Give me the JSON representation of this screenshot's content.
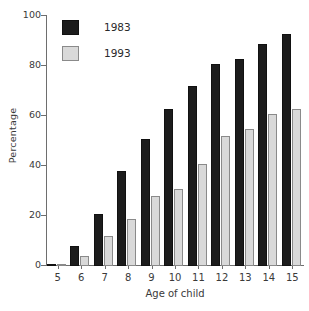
{
  "chart_data": {
    "type": "bar",
    "title": "",
    "xlabel": "Age of child",
    "ylabel": "Percentage",
    "categories": [
      "5",
      "6",
      "7",
      "8",
      "9",
      "10",
      "11",
      "12",
      "13",
      "14",
      "15"
    ],
    "series": [
      {
        "name": "1983",
        "color": "#1c1c1c",
        "values": [
          1,
          8,
          21,
          38,
          51,
          63,
          72,
          81,
          83,
          89,
          93
        ]
      },
      {
        "name": "1993",
        "color": "#d9d9d9",
        "values": [
          1,
          4,
          12,
          19,
          28,
          31,
          41,
          52,
          55,
          61,
          63
        ]
      }
    ],
    "ylim": [
      0,
      100
    ],
    "yticks": [
      0,
      20,
      40,
      60,
      80,
      100
    ],
    "ytick_labels": [
      "0",
      "20",
      "40",
      "60",
      "80",
      "100"
    ],
    "grid": false,
    "legend_position": "top-left"
  }
}
